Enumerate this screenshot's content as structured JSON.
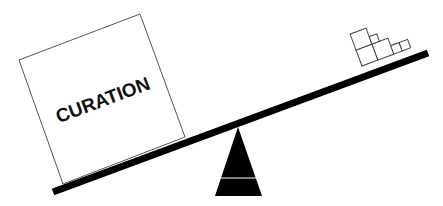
{
  "diagram": {
    "type": "seesaw-balance",
    "heavy_side": {
      "label": "CURATION",
      "shape": "large-square-box"
    },
    "light_side": {
      "label": "",
      "shape": "stack-of-small-boxes",
      "box_count": 6
    },
    "fulcrum": "black-triangle",
    "colors": {
      "beam": "#000000",
      "fulcrum": "#000000",
      "box_stroke": "#555555",
      "background": "#ffffff"
    }
  }
}
